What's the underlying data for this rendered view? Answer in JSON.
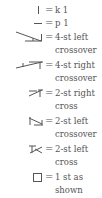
{
  "legend": {
    "equals": "=",
    "items": [
      {
        "symbol": "vertical-bar-icon",
        "label": "k 1"
      },
      {
        "symbol": "horizontal-dash-icon",
        "label": "p 1"
      },
      {
        "symbol": "four-st-left-crossover-icon",
        "label": "4-st left",
        "label2": "crossover"
      },
      {
        "symbol": "four-st-right-crossover-icon",
        "label": "4-st right",
        "label2": "crossover"
      },
      {
        "symbol": "two-st-right-cross-icon",
        "label": "2-st right",
        "label2": "cross"
      },
      {
        "symbol": "two-st-left-crossover-icon",
        "label": "2-st left",
        "label2": "crossover"
      },
      {
        "symbol": "two-st-left-cross-icon",
        "label": "2-st left",
        "label2": "cross"
      },
      {
        "symbol": "empty-square-icon",
        "label": "1 st as",
        "label2": "shown"
      }
    ]
  }
}
